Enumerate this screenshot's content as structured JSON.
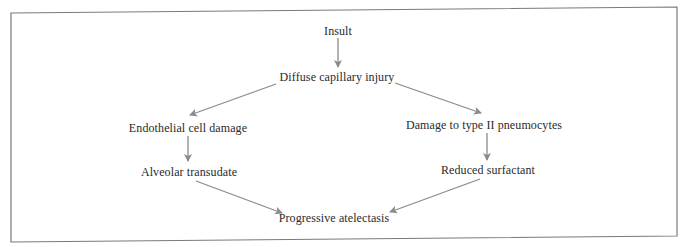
{
  "diagram": {
    "type": "flowchart",
    "nodes": {
      "insult": {
        "label": "Insult"
      },
      "diffuse": {
        "label": "Diffuse capillary injury"
      },
      "endothelial": {
        "label": "Endothelial  cell damage"
      },
      "type2": {
        "label": "Damage to type II pneumocytes"
      },
      "alveolar": {
        "label": "Alveolar transudate"
      },
      "surfactant": {
        "label": "Reduced surfactant"
      },
      "atelectasis": {
        "label": "Progressive atelectasis"
      }
    },
    "edges": [
      {
        "from": "Insult",
        "to": "Diffuse capillary injury"
      },
      {
        "from": "Diffuse capillary injury",
        "to": "Endothelial cell damage"
      },
      {
        "from": "Diffuse capillary injury",
        "to": "Damage to type II pneumocytes"
      },
      {
        "from": "Endothelial cell damage",
        "to": "Alveolar transudate"
      },
      {
        "from": "Damage to type II pneumocytes",
        "to": "Reduced surfactant"
      },
      {
        "from": "Alveolar transudate",
        "to": "Progressive atelectasis"
      },
      {
        "from": "Reduced surfactant",
        "to": "Progressive atelectasis"
      }
    ],
    "colors": {
      "arrow": "#8a8a8a",
      "text": "#2a2a2a",
      "border": "#7a7a7a"
    }
  }
}
